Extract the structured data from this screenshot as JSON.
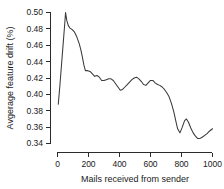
{
  "chart_data": {
    "type": "line",
    "title": "",
    "xlabel": "Mails received from sender",
    "ylabel": "Avgerage feature drift (%)",
    "xlim": [
      0,
      1000
    ],
    "ylim": [
      0.34,
      0.5
    ],
    "grid": false,
    "legend": "none",
    "line_color": "#3a3a3a",
    "axis_color": "#2b2b2b",
    "background_color": "#ffffff",
    "xticks": [
      0,
      200,
      400,
      600,
      800,
      1000
    ],
    "xtick_labels": [
      "0",
      "200",
      "400",
      "600",
      "800",
      "1000"
    ],
    "yticks": [
      0.34,
      0.36,
      0.38,
      0.4,
      0.42,
      0.44,
      0.46,
      0.48,
      0.5
    ],
    "ytick_labels": [
      "0.34",
      "0.36",
      "0.38",
      "0.40",
      "0.42",
      "0.44",
      "0.46",
      "0.48",
      "0.50"
    ],
    "series": [
      {
        "name": "average feature drift",
        "x": [
          5,
          15,
          25,
          35,
          45,
          52,
          60,
          70,
          80,
          95,
          110,
          125,
          140,
          150,
          160,
          170,
          180,
          195,
          210,
          225,
          240,
          255,
          270,
          285,
          300,
          315,
          330,
          345,
          360,
          375,
          390,
          405,
          420,
          435,
          450,
          465,
          480,
          495,
          510,
          525,
          540,
          555,
          570,
          585,
          600,
          615,
          630,
          645,
          660,
          675,
          690,
          705,
          720,
          735,
          750,
          765,
          775,
          790,
          805,
          820,
          832,
          845,
          860,
          875,
          890,
          905,
          918,
          935,
          950,
          965,
          980,
          1000
        ],
        "y": [
          0.388,
          0.41,
          0.434,
          0.458,
          0.482,
          0.5,
          0.49,
          0.484,
          0.481,
          0.479,
          0.476,
          0.47,
          0.462,
          0.455,
          0.446,
          0.436,
          0.429,
          0.429,
          0.428,
          0.425,
          0.422,
          0.423,
          0.421,
          0.417,
          0.417,
          0.418,
          0.419,
          0.419,
          0.417,
          0.413,
          0.409,
          0.405,
          0.406,
          0.409,
          0.412,
          0.415,
          0.418,
          0.42,
          0.421,
          0.419,
          0.416,
          0.412,
          0.411,
          0.414,
          0.417,
          0.417,
          0.414,
          0.412,
          0.411,
          0.409,
          0.406,
          0.402,
          0.397,
          0.389,
          0.379,
          0.366,
          0.358,
          0.353,
          0.36,
          0.368,
          0.37,
          0.366,
          0.359,
          0.353,
          0.349,
          0.346,
          0.346,
          0.348,
          0.35,
          0.352,
          0.355,
          0.358
        ]
      }
    ]
  }
}
